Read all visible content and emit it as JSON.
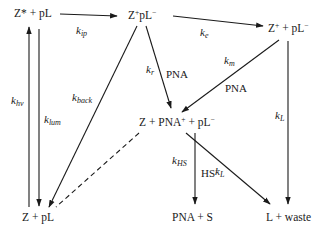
{
  "nodes": {
    "excited": {
      "base": "Z* + pL"
    },
    "ion_pair": {
      "base": "Z",
      "sup1": "+",
      "mid": "pL",
      "sup2": "−"
    },
    "separated": {
      "base": "Z",
      "sup1": "+",
      "mid": " + pL",
      "sup2": "−"
    },
    "pna_complex": {
      "base": "Z + PNA",
      "sup1": "+",
      "mid": " + pL",
      "sup2": "−"
    },
    "ground": {
      "base": "Z + pL"
    },
    "pna_s": {
      "base": "PNA + S"
    },
    "waste": {
      "base": "L + waste"
    }
  },
  "edges": {
    "k_ip": {
      "k": "k",
      "sub": "ip"
    },
    "k_e": {
      "k": "k",
      "sub": "e"
    },
    "k_r": {
      "k": "k",
      "sub": "r",
      "reagent": "PNA"
    },
    "k_m": {
      "k": "k",
      "sub": "m",
      "reagent": "PNA"
    },
    "k_back": {
      "k": "k",
      "sub": "back"
    },
    "k_hv": {
      "k": "k",
      "sub": "hv"
    },
    "k_lum": {
      "k": "k",
      "sub": "lum"
    },
    "k_L_right": {
      "k": "k",
      "sub": "L"
    },
    "k_HS": {
      "k": "k",
      "sub": "HS",
      "reagent": "HS",
      "reagent_sup": "−"
    },
    "k_L_diag": {
      "k": "k",
      "sub": "L"
    }
  },
  "colors": {
    "ink": "#1a1a1a",
    "background": "#ffffff"
  }
}
